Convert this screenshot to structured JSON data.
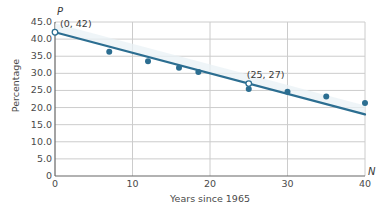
{
  "chart_data": {
    "type": "scatter",
    "title": "",
    "xlabel": "Years since 1965",
    "ylabel": "Percentage",
    "x_axis_name": "N",
    "y_axis_name": "P",
    "xlim": [
      0,
      40
    ],
    "ylim": [
      0,
      45
    ],
    "grid": true,
    "legend": "none",
    "xticks": [
      "0",
      "10",
      "20",
      "30",
      "40"
    ],
    "xtick_values": [
      0,
      10,
      20,
      30,
      40
    ],
    "yticks": [
      "0",
      "5.0",
      "10.0",
      "15.0",
      "20.0",
      "25.0",
      "30.0",
      "35.0",
      "40.0",
      "45.0"
    ],
    "ytick_values": [
      0,
      5,
      10,
      15,
      20,
      25,
      30,
      35,
      40,
      45
    ],
    "series": [
      {
        "name": "Data points",
        "type": "scatter",
        "marker": "filled-circle",
        "color": "#2c6e91",
        "points": [
          {
            "x": 7,
            "y": 36.3
          },
          {
            "x": 12,
            "y": 33.5
          },
          {
            "x": 16,
            "y": 31.6
          },
          {
            "x": 18.5,
            "y": 30.4
          },
          {
            "x": 25,
            "y": 25.4
          },
          {
            "x": 30,
            "y": 24.6
          },
          {
            "x": 35,
            "y": 23.2
          },
          {
            "x": 40,
            "y": 21.3
          }
        ]
      },
      {
        "name": "Trend line",
        "type": "line",
        "color": "#2c6e91",
        "points": [
          {
            "x": 0,
            "y": 42
          },
          {
            "x": 40,
            "y": 18
          }
        ]
      },
      {
        "name": "Highlighted points",
        "type": "scatter",
        "marker": "open-circle",
        "color": "#2c6e91",
        "points": [
          {
            "x": 0,
            "y": 42,
            "label": "(0, 42)"
          },
          {
            "x": 25,
            "y": 27,
            "label": "(25, 27)"
          }
        ]
      }
    ],
    "annotations": [
      {
        "text": "(0, 42)",
        "x": 0,
        "y": 42
      },
      {
        "text": "(25, 27)",
        "x": 25,
        "y": 27
      }
    ]
  },
  "colors": {
    "line": "#2c6e91",
    "marker": "#2c6e91",
    "grid": "#cccccc",
    "axis": "#888888",
    "text": "#4a4a4a",
    "background": "#ffffff",
    "band": "#eaf1f6"
  }
}
